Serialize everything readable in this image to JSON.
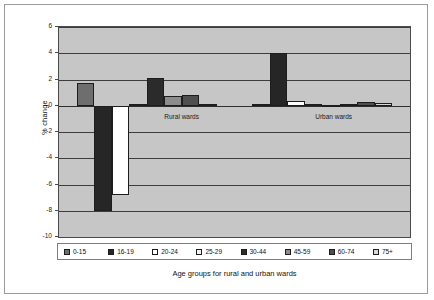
{
  "chart_data": {
    "type": "bar",
    "title": "",
    "xlabel": "Age groups for rural and urban wards",
    "ylabel": "% change",
    "ylim": [
      -10,
      6
    ],
    "ytick_values": [
      6,
      4,
      2,
      0,
      -2,
      -4,
      -6,
      -8,
      -10
    ],
    "ytick_labels": [
      "6",
      "4",
      "2",
      "0",
      "-2",
      "-4",
      "-6",
      "-8",
      "-10"
    ],
    "grid": true,
    "legend_position": "bottom",
    "categories": [
      "0-15",
      "16-19",
      "20-24",
      "25-29",
      "30-44",
      "45-59",
      "60-74",
      "75+"
    ],
    "groups": [
      "Rural wards",
      "Urban wards"
    ],
    "annotations": [
      {
        "text": "Rural wards",
        "x_frac": 0.3,
        "value": 0.0
      },
      {
        "text": "Urban wards",
        "x_frac": 0.73,
        "value": 0.0
      }
    ],
    "series": [
      {
        "name": "Rural wards",
        "values": [
          1.75,
          -8.05,
          -6.8,
          0.1,
          2.1,
          0.75,
          0.8,
          0.15
        ]
      },
      {
        "name": "Urban wards",
        "values": [
          0.1,
          4.05,
          0.35,
          0.1,
          0.05,
          0.1,
          0.3,
          0.2
        ]
      }
    ],
    "colors": {
      "0-15": "#6e6e6e",
      "16-19": "#262626",
      "20-24": "#ffffff",
      "25-29": "#f2f2f2",
      "30-44": "#2b2b2b",
      "45-59": "#8c8c8c",
      "60-74": "#4f4f4f",
      "75+": "#d9d9d9",
      "plot_background": "#c6c6c6",
      "gridline": "#3d3d3d",
      "border": "#4a4a4a",
      "page_background": "#ffffff"
    }
  }
}
